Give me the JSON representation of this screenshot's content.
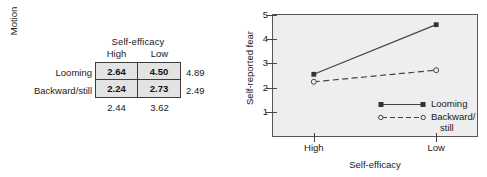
{
  "table": {
    "column_group_label": "Self-efficacy",
    "column_headers": [
      "High",
      "Low"
    ],
    "row_group_label": "Motion",
    "row_headers": [
      "Looming",
      "Backward/still"
    ],
    "cells": [
      [
        "2.64",
        "4.50"
      ],
      [
        "2.24",
        "2.73"
      ]
    ],
    "row_margins": [
      "4.89",
      "2.49"
    ],
    "column_margins": [
      "2.44",
      "3.62"
    ],
    "cell_fill_color": "#e3e3e3",
    "border_color": "#3d3d3d"
  },
  "chart_data": {
    "type": "line",
    "title": "",
    "xlabel": "Self-efficacy",
    "ylabel": "Self-reported fear",
    "categories": [
      "High",
      "Low"
    ],
    "x_tick_labels": [
      "High",
      "Low"
    ],
    "y_tick_labels": [
      "1",
      "2",
      "3",
      "4",
      "5"
    ],
    "y_ticks": [
      1,
      2,
      3,
      4,
      5
    ],
    "ylim": [
      0,
      5
    ],
    "xlim": [
      0,
      1
    ],
    "grid": false,
    "legend_position": "inside-bottom-right",
    "panel_background": "#eeeeee",
    "series": [
      {
        "name": "Looming",
        "values": [
          2.55,
          4.6
        ],
        "line_style": "solid",
        "marker": "filled-square",
        "color": "#444444"
      },
      {
        "name": "Backward/still",
        "legend_line_1": "Backward/",
        "legend_line_2": "still",
        "values": [
          2.24,
          2.72
        ],
        "line_style": "dashed",
        "marker": "open-circle",
        "color": "#444444"
      }
    ]
  }
}
